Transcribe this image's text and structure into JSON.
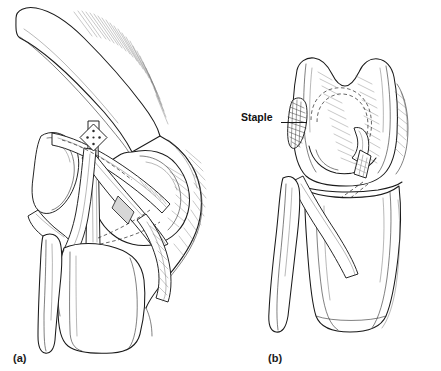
{
  "figure": {
    "background_color": "#ffffff",
    "ink_color": "#1a1a1a",
    "style": "black-and-white medical line drawing",
    "panels": [
      {
        "id": "a",
        "caption": "(a)",
        "view": "lateral view of flexed knee",
        "structures": [
          "femur",
          "patella",
          "tibia",
          "fibula",
          "graft strips",
          "staple"
        ]
      },
      {
        "id": "b",
        "caption": "(b)",
        "view": "anterior view of extended knee",
        "structures": [
          "distal femur condyles",
          "tibia",
          "fibula",
          "graft",
          "staple",
          "tunnel outline"
        ]
      }
    ]
  },
  "captions": {
    "panel_a": "(a)",
    "panel_b": "(b)"
  },
  "annotations": [
    {
      "id": "staple-callout",
      "label": "Staple",
      "leader": "horizontal line pointing right to the staple on the medial femoral condyle"
    }
  ],
  "colors": {
    "background": "#ffffff",
    "line": "#1a1a1a",
    "hatch": "#6e6e6e",
    "shade": "#d7d7d7",
    "staple_dark": "#4a4a4a"
  }
}
